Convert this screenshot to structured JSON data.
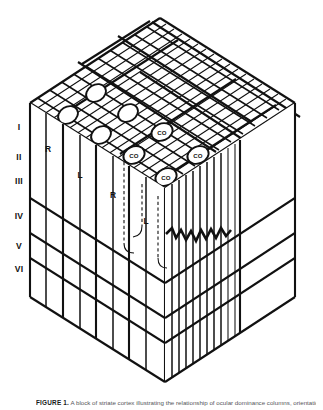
{
  "figure": {
    "domain_label": "cortical-column-model",
    "caption_label": "FIGURE 1.",
    "caption_text": "A block of striate cortex illustrating the relationship of ocular dominance columns, orientation columns and cytochrome oxidase blobs."
  },
  "layers": {
    "title": "Cortical layers",
    "items": [
      {
        "label": "I",
        "y": 127
      },
      {
        "label": "II",
        "y": 157
      },
      {
        "label": "III",
        "y": 181
      },
      {
        "label": "IV",
        "y": 216
      },
      {
        "label": "V",
        "y": 246
      },
      {
        "label": "VI",
        "y": 269
      }
    ]
  },
  "ocular_dominance": {
    "description": "Right and left eye dominance column labels",
    "labels": [
      {
        "text": "R",
        "x": 48,
        "y": 150,
        "face": "front-left-upper"
      },
      {
        "text": "L",
        "x": 80,
        "y": 176,
        "face": "front-left-middle"
      },
      {
        "text": "R",
        "x": 113,
        "y": 196,
        "face": "front-left-lower"
      },
      {
        "text": "L",
        "x": 146,
        "y": 222,
        "face": "front-left-lower"
      }
    ]
  },
  "co_blobs": {
    "description": "Cytochrome oxidase blobs on the pial surface",
    "label_text": "CO",
    "labeled": [
      {
        "text": "CO",
        "cx": 162,
        "cy": 132
      },
      {
        "text": "CO",
        "cx": 134,
        "cy": 155
      },
      {
        "text": "CO",
        "cx": 198,
        "cy": 155
      },
      {
        "text": "CO",
        "cx": 166,
        "cy": 177
      }
    ],
    "plain_count": 4
  },
  "colors": {
    "ink": "#111111",
    "paper": "#ffffff",
    "caption": "#55565a"
  },
  "orientation_columns": {
    "description": "Zigzag line across vertical stripes on the front-right face indicating sequential orientation shift"
  }
}
